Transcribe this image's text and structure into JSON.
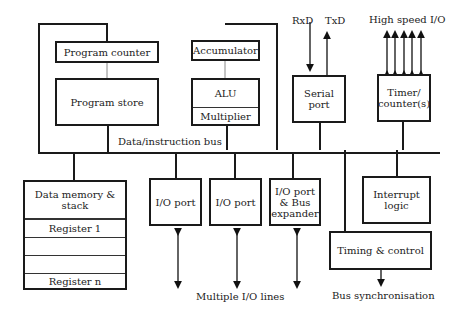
{
  "diagram": {
    "type": "microcontroller block diagram",
    "bus_label": "Data/instruction bus",
    "blocks": {
      "program_counter": "Program counter",
      "program_store": "Program store",
      "accumulator": "Accumulator",
      "alu": "ALU",
      "multiplier": "Multiplier",
      "serial_port": "Serial port",
      "timer_counter": "Timer/ counter(s)",
      "data_memory": "Data memory & stack",
      "register_1": "Register 1",
      "register_n": "Register n",
      "io_port_1": "I/O port",
      "io_port_2": "I/O port",
      "io_port_expander": "I/O port & Bus expander",
      "interrupt_logic": "Interrupt logic",
      "timing_control": "Timing & control"
    },
    "signals": {
      "rxd": "RxD",
      "txd": "TxD",
      "high_speed_io": "High speed I/O",
      "multiple_io_lines": "Multiple I/O lines",
      "bus_sync": "Bus synchronisation"
    }
  }
}
